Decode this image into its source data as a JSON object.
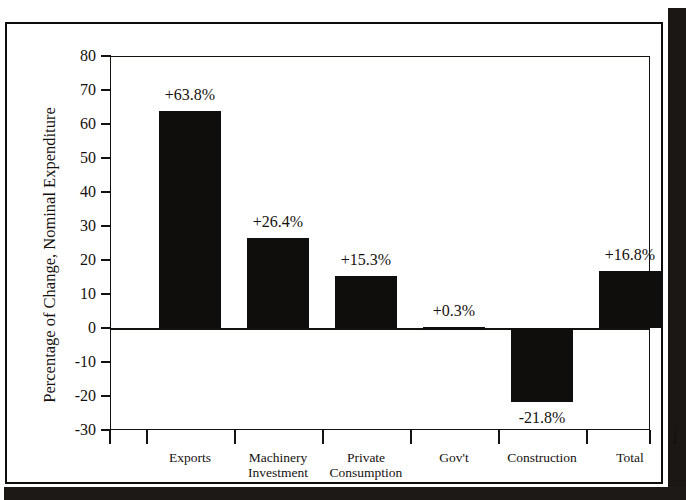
{
  "page": {
    "top_cropped_text": "",
    "background_color": "#ffffff",
    "frame_color": "#0d0d0d"
  },
  "chart_data": {
    "type": "bar",
    "title": "",
    "xlabel": "",
    "ylabel": "Percentage of Change, Nominal Expenditure",
    "categories": [
      "Exports",
      "Machinery Investment",
      "Private Consumption",
      "Gov't",
      "Construction",
      "Total"
    ],
    "category_lines": [
      [
        "Exports"
      ],
      [
        "Machinery",
        "Investment"
      ],
      [
        "Private",
        "Consumption"
      ],
      [
        "Gov't"
      ],
      [
        "Construction"
      ],
      [
        "Total"
      ]
    ],
    "values": [
      63.8,
      26.4,
      15.3,
      0.3,
      -21.8,
      16.8
    ],
    "value_labels": [
      "+63.8%",
      "+26.4%",
      "+15.3%",
      "+0.3%",
      "-21.8%",
      "+16.8%"
    ],
    "ylim": [
      -30,
      80
    ],
    "yticks": [
      80,
      70,
      60,
      50,
      40,
      30,
      20,
      10,
      0,
      -10,
      -20,
      -30
    ],
    "ytick_labels": [
      "80",
      "70",
      "60",
      "50",
      "40",
      "30",
      "20",
      "10",
      "0",
      "-10",
      "-20",
      "-30"
    ],
    "grid": false,
    "legend": "none",
    "bar_color": "#100e0c",
    "axis_color": "#15110e"
  }
}
